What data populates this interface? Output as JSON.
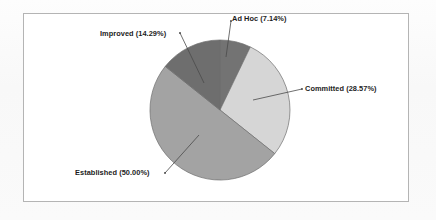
{
  "chart_data": {
    "type": "pie",
    "title": "",
    "subtitle": "",
    "xlabel": "",
    "ylabel": "",
    "legend_position": "none",
    "grid": false,
    "labels_inline": true,
    "categories": [
      "Ad Hoc",
      "Committed",
      "Established",
      "Improved"
    ],
    "values": [
      7.14,
      28.57,
      50.0,
      14.29
    ],
    "value_unit": "%",
    "start_angle_deg": 0,
    "direction": "clockwise",
    "slices": [
      {
        "name": "Ad Hoc",
        "percent": 7.14,
        "label": "Ad Hoc (7.14%)",
        "color": "#737373",
        "start_deg": 0,
        "end_deg": 25.7
      },
      {
        "name": "Committed",
        "percent": 28.57,
        "label": "Committed (28.57%)",
        "color": "#d6d6d6",
        "start_deg": 25.7,
        "end_deg": 128.6
      },
      {
        "name": "Established",
        "percent": 50.0,
        "label": "Established (50.00%)",
        "color": "#a3a3a3",
        "start_deg": 128.6,
        "end_deg": 308.6
      },
      {
        "name": "Improved",
        "percent": 14.29,
        "label": "Improved (14.29%)",
        "color": "#6e6e6e",
        "start_deg": 308.6,
        "end_deg": 360
      }
    ]
  },
  "frame": {
    "border_color": "#b4b4b4",
    "background_color": "#ffffff"
  },
  "labels": {
    "ad_hoc": "Ad Hoc (7.14%)",
    "committed": "Committed (28.57%)",
    "established": "Established (50.00%)",
    "improved": "Improved (14.29%)"
  }
}
